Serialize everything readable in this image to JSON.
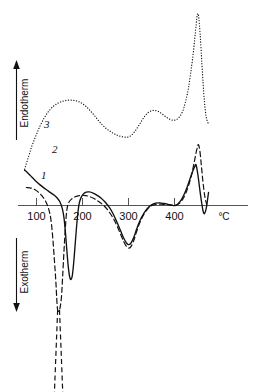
{
  "chart_data": {
    "type": "line",
    "title": "",
    "subtitle": "",
    "xlabel": "°C",
    "ylabel_positive": "Endotherm",
    "ylabel_negative": "Exotherm",
    "xlim": [
      70,
      480
    ],
    "xticks": [
      100,
      200,
      300,
      400
    ],
    "xtick_labels": [
      "100",
      "200",
      "300",
      "400"
    ],
    "grid": false,
    "legend_position": "inline-curve-labels",
    "baseline_value": 0,
    "annotations": [
      {
        "text": "3",
        "curve": "3",
        "x": 120,
        "y_note": "above dotted curve near left rise"
      },
      {
        "text": "2",
        "curve": "2",
        "x": 128,
        "y_note": "right of solid curve start"
      },
      {
        "text": "1",
        "curve": "1",
        "x": 112,
        "y_note": "right of dashed curve start"
      },
      {
        "text": "Endotherm",
        "axis": "y-positive",
        "arrow": "up"
      },
      {
        "text": "Exotherm",
        "axis": "y-negative",
        "arrow": "down"
      },
      {
        "text": "°C",
        "axis": "x",
        "position": "right-end"
      }
    ],
    "series": [
      {
        "name": "1",
        "label": "1",
        "style": "dashed",
        "color": "#111111",
        "description": "Dashed DTA curve with very deep off-scale exotherm near 150 °C, broad endotherm hump near 205 °C, deep exotherm minimum near 300 °C, and tall sharp endotherm peak near 455 °C.",
        "points": [
          [
            78,
            0.62
          ],
          [
            88,
            0.6
          ],
          [
            96,
            0.55
          ],
          [
            104,
            0.46
          ],
          [
            112,
            0.33
          ],
          [
            120,
            0.14
          ],
          [
            126,
            -0.1
          ],
          [
            131,
            -0.45
          ],
          [
            135,
            -1.05
          ],
          [
            139,
            -1.9
          ],
          [
            142,
            -2.6
          ],
          [
            144,
            -3.2
          ],
          [
            146,
            -3.6
          ],
          [
            150,
            -3.6
          ],
          [
            154,
            -3.2
          ],
          [
            157,
            -2.4
          ],
          [
            160,
            -1.5
          ],
          [
            163,
            -0.7
          ],
          [
            166,
            -0.15
          ],
          [
            170,
            0.1
          ],
          [
            176,
            0.22
          ],
          [
            184,
            0.3
          ],
          [
            193,
            0.34
          ],
          [
            203,
            0.35
          ],
          [
            213,
            0.32
          ],
          [
            224,
            0.25
          ],
          [
            235,
            0.14
          ],
          [
            246,
            0.0
          ],
          [
            256,
            -0.18
          ],
          [
            266,
            -0.42
          ],
          [
            275,
            -0.7
          ],
          [
            283,
            -1.0
          ],
          [
            290,
            -1.26
          ],
          [
            296,
            -1.42
          ],
          [
            301,
            -1.47
          ],
          [
            306,
            -1.4
          ],
          [
            312,
            -1.18
          ],
          [
            318,
            -0.88
          ],
          [
            325,
            -0.58
          ],
          [
            333,
            -0.32
          ],
          [
            341,
            -0.13
          ],
          [
            350,
            -0.01
          ],
          [
            359,
            0.04
          ],
          [
            369,
            0.05
          ],
          [
            379,
            0.04
          ],
          [
            389,
            0.02
          ],
          [
            397,
            0.0
          ],
          [
            404,
            0.01
          ],
          [
            411,
            0.08
          ],
          [
            418,
            0.22
          ],
          [
            425,
            0.44
          ],
          [
            432,
            0.76
          ],
          [
            438,
            1.12
          ],
          [
            443,
            1.5
          ],
          [
            447,
            1.83
          ],
          [
            450,
            2.02
          ],
          [
            452,
            2.1
          ],
          [
            455,
            1.9
          ],
          [
            458,
            1.45
          ],
          [
            461,
            0.95
          ],
          [
            464,
            0.52
          ],
          [
            467,
            0.22
          ],
          [
            470,
            0.05
          ]
        ]
      },
      {
        "name": "2",
        "label": "2",
        "style": "solid",
        "color": "#111111",
        "description": "Solid DTA curve starting high at left, sharp narrow exotherm minimum near 170 °C, endotherm hump near 210 °C, deep exotherm minimum near 300 °C, then sharp endotherm peak near 447 °C followed by a dip and recovery at the right edge.",
        "points": [
          [
            74,
            1.22
          ],
          [
            80,
            1.14
          ],
          [
            87,
            1.03
          ],
          [
            95,
            0.9
          ],
          [
            103,
            0.78
          ],
          [
            112,
            0.66
          ],
          [
            121,
            0.55
          ],
          [
            130,
            0.45
          ],
          [
            138,
            0.36
          ],
          [
            145,
            0.26
          ],
          [
            151,
            0.12
          ],
          [
            156,
            -0.1
          ],
          [
            160,
            -0.45
          ],
          [
            163,
            -0.95
          ],
          [
            166,
            -1.55
          ],
          [
            169,
            -2.1
          ],
          [
            172,
            -2.45
          ],
          [
            175,
            -2.55
          ],
          [
            178,
            -2.4
          ],
          [
            181,
            -1.95
          ],
          [
            184,
            -1.35
          ],
          [
            187,
            -0.75
          ],
          [
            190,
            -0.25
          ],
          [
            193,
            0.08
          ],
          [
            197,
            0.28
          ],
          [
            202,
            0.4
          ],
          [
            208,
            0.46
          ],
          [
            215,
            0.47
          ],
          [
            223,
            0.43
          ],
          [
            231,
            0.36
          ],
          [
            240,
            0.26
          ],
          [
            249,
            0.12
          ],
          [
            258,
            -0.06
          ],
          [
            267,
            -0.3
          ],
          [
            275,
            -0.58
          ],
          [
            283,
            -0.88
          ],
          [
            290,
            -1.14
          ],
          [
            296,
            -1.3
          ],
          [
            301,
            -1.35
          ],
          [
            306,
            -1.28
          ],
          [
            312,
            -1.08
          ],
          [
            318,
            -0.8
          ],
          [
            325,
            -0.52
          ],
          [
            333,
            -0.28
          ],
          [
            341,
            -0.1
          ],
          [
            350,
            0.02
          ],
          [
            359,
            0.08
          ],
          [
            368,
            0.09
          ],
          [
            377,
            0.07
          ],
          [
            386,
            0.04
          ],
          [
            394,
            0.01
          ],
          [
            401,
            0.0
          ],
          [
            408,
            0.06
          ],
          [
            415,
            0.2
          ],
          [
            422,
            0.42
          ],
          [
            429,
            0.7
          ],
          [
            435,
            0.98
          ],
          [
            440,
            1.2
          ],
          [
            444,
            1.34
          ],
          [
            447,
            1.4
          ],
          [
            451,
            1.05
          ],
          [
            455,
            0.55
          ],
          [
            459,
            0.1
          ],
          [
            462,
            -0.18
          ],
          [
            465,
            -0.28
          ],
          [
            469,
            -0.1
          ],
          [
            472,
            0.22
          ],
          [
            474,
            0.45
          ]
        ]
      },
      {
        "name": "3",
        "label": "3",
        "style": "dotted",
        "color": "#111111",
        "description": "Dotted DTA curve rising from the left, broad endotherm hump near 195 °C, shallow dip near 300 °C, second hump near 350 °C, shallow dip near 400 °C, then a very large sharp endotherm peak near 450 °C.",
        "points": [
          [
            74,
            1.25
          ],
          [
            82,
            1.65
          ],
          [
            90,
            2.05
          ],
          [
            99,
            2.42
          ],
          [
            108,
            2.75
          ],
          [
            118,
            3.05
          ],
          [
            128,
            3.28
          ],
          [
            138,
            3.44
          ],
          [
            148,
            3.54
          ],
          [
            158,
            3.6
          ],
          [
            168,
            3.63
          ],
          [
            178,
            3.63
          ],
          [
            188,
            3.6
          ],
          [
            197,
            3.54
          ],
          [
            206,
            3.44
          ],
          [
            215,
            3.3
          ],
          [
            224,
            3.14
          ],
          [
            233,
            2.96
          ],
          [
            242,
            2.8
          ],
          [
            251,
            2.66
          ],
          [
            260,
            2.56
          ],
          [
            268,
            2.48
          ],
          [
            276,
            2.42
          ],
          [
            284,
            2.38
          ],
          [
            292,
            2.36
          ],
          [
            299,
            2.36
          ],
          [
            306,
            2.42
          ],
          [
            313,
            2.54
          ],
          [
            320,
            2.7
          ],
          [
            327,
            2.88
          ],
          [
            334,
            3.05
          ],
          [
            341,
            3.18
          ],
          [
            349,
            3.26
          ],
          [
            357,
            3.28
          ],
          [
            365,
            3.24
          ],
          [
            373,
            3.16
          ],
          [
            381,
            3.06
          ],
          [
            389,
            2.98
          ],
          [
            397,
            2.94
          ],
          [
            404,
            2.96
          ],
          [
            411,
            3.06
          ],
          [
            418,
            3.26
          ],
          [
            424,
            3.58
          ],
          [
            430,
            4.02
          ],
          [
            435,
            4.55
          ],
          [
            440,
            5.15
          ],
          [
            444,
            5.75
          ],
          [
            447,
            6.22
          ],
          [
            449,
            6.52
          ],
          [
            451,
            6.62
          ],
          [
            453,
            6.45
          ],
          [
            456,
            5.85
          ],
          [
            459,
            5.05
          ],
          [
            462,
            4.25
          ],
          [
            465,
            3.6
          ],
          [
            468,
            3.15
          ],
          [
            471,
            2.92
          ],
          [
            474,
            2.82
          ]
        ]
      }
    ]
  },
  "axes": {
    "x_unit_label": "°C",
    "tick_labels": [
      "100",
      "200",
      "300",
      "400"
    ],
    "endotherm_label": "Endotherm",
    "exotherm_label": "Exotherm"
  },
  "curve_labels": {
    "one": "1",
    "two": "2",
    "three": "3"
  },
  "colors": {
    "ink": "#111111",
    "background": "#ffffff",
    "axis": "#555555"
  }
}
